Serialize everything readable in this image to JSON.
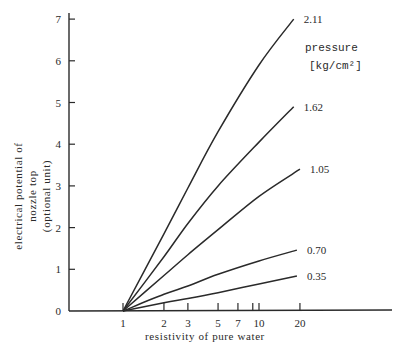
{
  "chart_data": {
    "type": "line",
    "title": "",
    "xlabel": "resistivity of pure water",
    "ylabel": [
      "electrical potential of",
      "nozzle top",
      "(optional unit)"
    ],
    "xscale": "log",
    "xlim": [
      0.2,
      40
    ],
    "ylim": [
      0,
      7.2
    ],
    "x_ticks": [
      1,
      2,
      3,
      5,
      7,
      9,
      10,
      20
    ],
    "x_tick_labels": [
      "1",
      "2",
      "3",
      "5",
      "7",
      "",
      "10",
      "20"
    ],
    "y_ticks": [
      0,
      1,
      2,
      3,
      4,
      5,
      6,
      7
    ],
    "y_tick_labels": [
      "0",
      "1",
      "2",
      "3",
      "4",
      "5",
      "6",
      "7"
    ],
    "grid": false,
    "legend": {
      "title": "pressure",
      "unit": "[kg/cm²]",
      "position": "upper right"
    },
    "baseline": {
      "y": 0,
      "x_start": "axis",
      "x_end_px": 392
    },
    "series": [
      {
        "name": "2.11",
        "x": [
          1,
          2,
          3,
          5,
          10,
          18
        ],
        "values": [
          0,
          1.85,
          2.95,
          4.3,
          5.9,
          7.0
        ]
      },
      {
        "name": "1.62",
        "x": [
          1,
          2,
          3,
          5,
          10,
          18
        ],
        "values": [
          0,
          1.3,
          2.1,
          3.0,
          4.05,
          4.9
        ]
      },
      {
        "name": "1.05",
        "x": [
          1,
          2,
          3,
          5,
          10,
          20
        ],
        "values": [
          0,
          0.85,
          1.35,
          1.95,
          2.75,
          3.4
        ]
      },
      {
        "name": "0.70",
        "x": [
          1,
          2,
          3,
          5,
          10,
          19
        ],
        "values": [
          0,
          0.4,
          0.6,
          0.88,
          1.2,
          1.46
        ]
      },
      {
        "name": "0.35",
        "x": [
          1,
          2,
          3,
          5,
          10,
          19
        ],
        "values": [
          0,
          0.2,
          0.3,
          0.44,
          0.65,
          0.84
        ]
      }
    ]
  },
  "layout_px": {
    "x_axis_px": 69,
    "y0_px": 311,
    "px_per_unit_y": 41.7,
    "x_log1_px": 123,
    "px_per_decade": 136
  }
}
